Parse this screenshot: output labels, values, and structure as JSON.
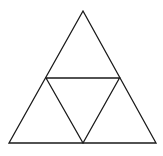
{
  "diagram": {
    "type": "subdivided-triangle",
    "stroke_color": "#1a1a1a",
    "background": "#ffffff",
    "outer_triangle": {
      "apex": [
        83,
        11
      ],
      "bottom_left": [
        9,
        143
      ],
      "bottom_right": [
        156,
        143
      ]
    },
    "midpoints": {
      "left": [
        46,
        78
      ],
      "right": [
        119.5,
        78
      ],
      "bottom": [
        83,
        143
      ]
    }
  }
}
